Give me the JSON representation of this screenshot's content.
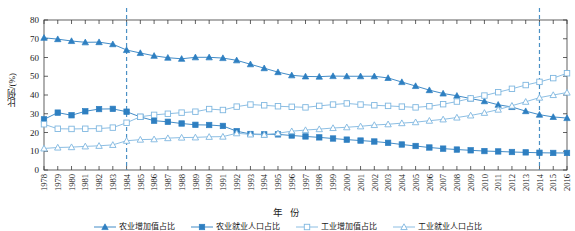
{
  "chart_data": {
    "type": "line",
    "title": "",
    "xlabel": "年 份",
    "ylabel": "比例/(%)",
    "ylim": [
      0,
      80
    ],
    "yticks": [
      0,
      10,
      20,
      30,
      40,
      50,
      60,
      70,
      80
    ],
    "grid": false,
    "legend_position": "bottom",
    "accent_color": "#2e7fc1",
    "marker_light_color": "#7fb7e0",
    "reference_lines": [
      {
        "x": "1984",
        "style": "dashed",
        "color": "#4a90c4"
      },
      {
        "x": "2014",
        "style": "dashed",
        "color": "#4a90c4"
      }
    ],
    "x": [
      "1978",
      "1979",
      "1980",
      "1981",
      "1982",
      "1983",
      "1984",
      "1985",
      "1986",
      "1987",
      "1988",
      "1989",
      "1990",
      "1991",
      "1992",
      "1993",
      "1994",
      "1995",
      "1996",
      "1997",
      "1998",
      "1999",
      "2000",
      "2001",
      "2002",
      "2003",
      "2004",
      "2005",
      "2006",
      "2007",
      "2008",
      "2009",
      "2010",
      "2011",
      "2012",
      "2013",
      "2014",
      "2015",
      "2016"
    ],
    "series": [
      {
        "name": "农业增加值占比",
        "marker": "filled-triangle",
        "color": "#2e7fc1",
        "values": [
          70.5,
          69.8,
          68.8,
          68.1,
          68.2,
          67.1,
          64.0,
          62.4,
          60.9,
          59.9,
          59.3,
          60.1,
          60.1,
          59.7,
          58.5,
          56.4,
          54.3,
          52.2,
          50.5,
          49.9,
          49.8,
          50.1,
          50.0,
          50.0,
          50.0,
          49.1,
          46.9,
          44.8,
          42.6,
          40.8,
          39.6,
          38.1,
          36.7,
          34.8,
          33.6,
          31.4,
          29.5,
          28.3,
          27.7
        ],
        "values_note": "leftmost series, declining from ~70.5 to ~27.7"
      },
      {
        "name": "农业就业人口占比",
        "marker": "filled-square",
        "color": "#2e7fc1",
        "values": [
          27.0,
          30.6,
          29.2,
          31.3,
          32.5,
          32.6,
          31.1,
          28.3,
          26.3,
          25.7,
          24.8,
          24.1,
          24.0,
          23.5,
          20.7,
          19.2,
          19.0,
          19.0,
          18.4,
          17.9,
          17.4,
          16.8,
          16.2,
          15.7,
          15.2,
          14.5,
          13.6,
          12.8,
          12.0,
          11.4,
          10.9,
          10.5,
          10.1,
          9.9,
          9.6,
          9.4,
          9.2,
          9.1,
          9.1
        ],
        "values_note": "filled squares, rising to 1982 then declining to ~9"
      },
      {
        "name": "工业增加值占比",
        "marker": "hollow-square",
        "color": "#7fb7e0",
        "values": [
          24.4,
          22.0,
          21.9,
          22.0,
          22.1,
          22.6,
          25.2,
          28.4,
          29.4,
          30.0,
          30.6,
          31.1,
          32.5,
          32.0,
          33.8,
          34.9,
          34.5,
          34.0,
          33.7,
          33.4,
          34.2,
          34.9,
          35.5,
          34.9,
          34.5,
          34.2,
          33.8,
          33.4,
          34.0,
          35.1,
          36.5,
          38.2,
          39.7,
          41.5,
          43.3,
          45.3,
          47.0,
          49.0,
          51.6
        ],
        "values_note": "hollow squares, rising from ~24 to ~52"
      },
      {
        "name": "工业就业人口占比",
        "marker": "hollow-triangle",
        "color": "#7fb7e0",
        "values": [
          11.5,
          12.0,
          12.2,
          12.6,
          12.9,
          13.4,
          15.6,
          16.2,
          16.4,
          17.0,
          17.3,
          17.4,
          17.7,
          17.8,
          19.6,
          19.0,
          18.8,
          19.6,
          20.7,
          21.3,
          21.8,
          22.4,
          22.8,
          23.3,
          24.0,
          24.4,
          25.0,
          25.5,
          26.3,
          27.0,
          28.0,
          29.1,
          30.5,
          32.2,
          34.3,
          36.4,
          38.6,
          40.0,
          41.3
        ],
        "values_note": "hollow triangles, rising from ~11.5 to ~41"
      }
    ]
  },
  "axis": {
    "ylabel": "比例/(%)",
    "xlabel": "年 份"
  },
  "legend": {
    "items": [
      {
        "label": "农业增加值占比",
        "marker": "filled-triangle"
      },
      {
        "label": "农业就业人口占比",
        "marker": "filled-square"
      },
      {
        "label": "工业增加值占比",
        "marker": "hollow-square"
      },
      {
        "label": "工业就业人口占比",
        "marker": "hollow-triangle"
      }
    ]
  }
}
